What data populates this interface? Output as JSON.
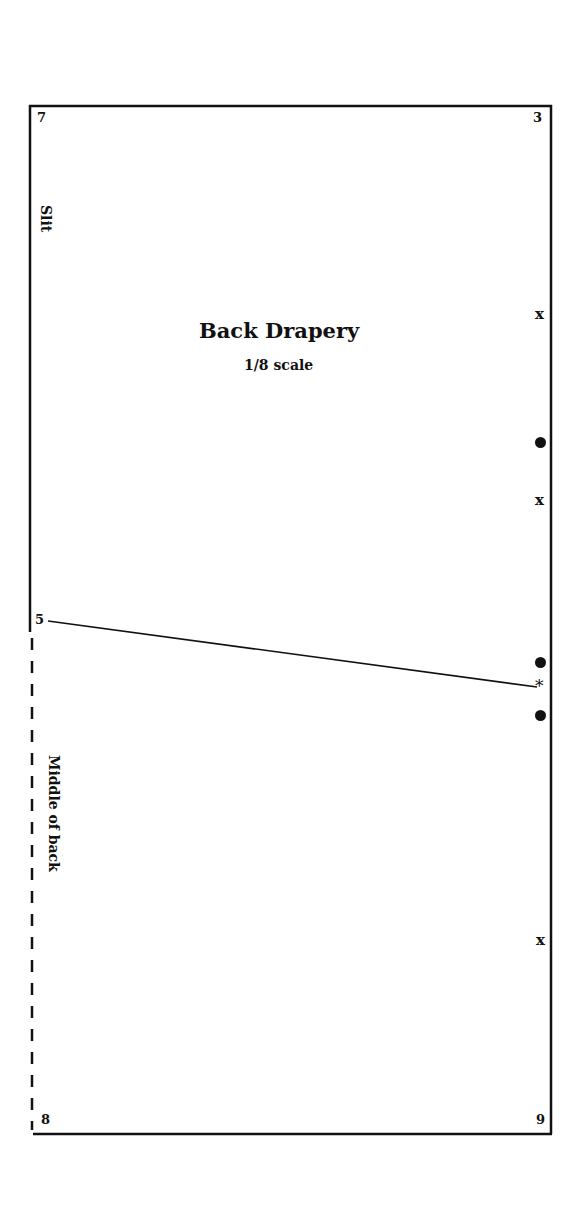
{
  "pattern": {
    "title": "Back Drapery",
    "scale": "1/8 scale",
    "corner_labels": {
      "top_left": "7",
      "top_right": "3",
      "left_mid": "5",
      "bottom_left": "8",
      "bottom_right": "9"
    },
    "edge_labels": {
      "slit": "Slit",
      "middle_of_back": "Middle of back"
    },
    "markers": [
      {
        "type": "x",
        "symbol": "x",
        "y": 317
      },
      {
        "type": "dot",
        "y": 442
      },
      {
        "type": "x",
        "symbol": "x",
        "y": 503
      },
      {
        "type": "dot",
        "y": 662
      },
      {
        "type": "asterisk",
        "symbol": "*",
        "y": 687
      },
      {
        "type": "dot",
        "y": 715
      },
      {
        "type": "x",
        "symbol": "x",
        "y": 943
      }
    ],
    "colors": {
      "line": "#111111",
      "background": "#ffffff"
    }
  }
}
